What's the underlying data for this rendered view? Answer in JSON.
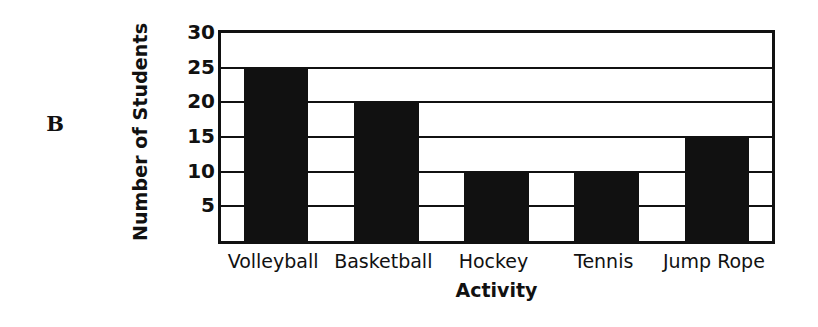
{
  "panel": {
    "letter": "B"
  },
  "chart_data": {
    "type": "bar",
    "title": "",
    "xlabel": "Activity",
    "ylabel": "Number of Students",
    "categories": [
      "Volleyball",
      "Basketball",
      "Hockey",
      "Tennis",
      "Jump Rope"
    ],
    "values": [
      25,
      20,
      10,
      10,
      15
    ],
    "yticks": [
      30,
      25,
      20,
      15,
      10,
      5
    ],
    "ytick_labels": [
      "30",
      "25",
      "20",
      "15",
      "10",
      "5"
    ],
    "ylim": [
      0,
      30
    ],
    "grid": true,
    "legend": null,
    "bar_color": "#111111",
    "frame_color": "#111111",
    "background": "#ffffff"
  }
}
